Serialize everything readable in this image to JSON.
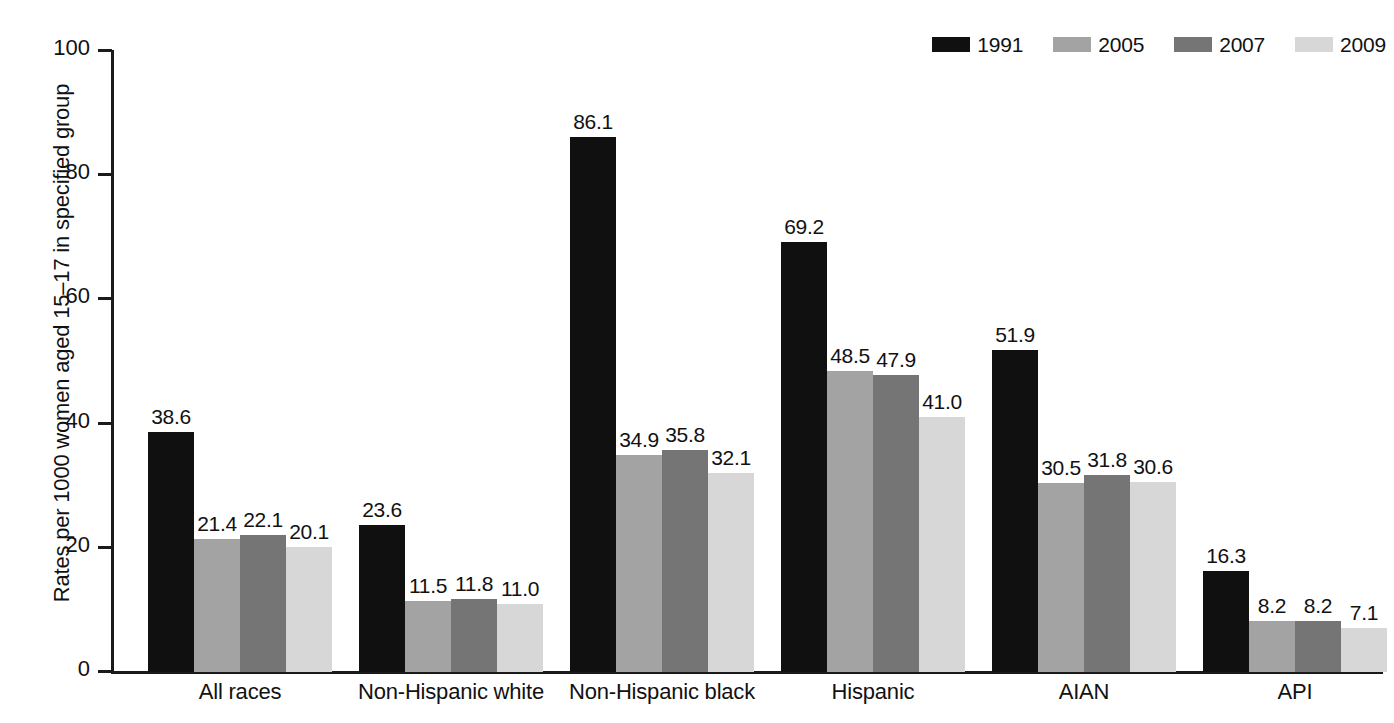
{
  "chart_data": {
    "type": "bar",
    "title": "",
    "subtitle": "",
    "xlabel": "",
    "ylabel": "Rates per 1000 women aged 15–17 in specified group",
    "ylim": [
      0,
      100
    ],
    "yticks": [
      0,
      20,
      40,
      60,
      80,
      100
    ],
    "ytick_labels": [
      "0",
      "20",
      "40",
      "60",
      "80",
      "100"
    ],
    "grid": false,
    "legend_position": "top-right",
    "categories": [
      "All races",
      "Non-Hispanic white",
      "Non-Hispanic black",
      "Hispanic",
      "AIAN",
      "API"
    ],
    "series": [
      {
        "name": "1991",
        "color": "#101010",
        "values": [
          38.6,
          23.6,
          86.1,
          69.2,
          51.9,
          16.3
        ],
        "labels": [
          "38.6",
          "23.6",
          "86.1",
          "69.2",
          "51.9",
          "16.3"
        ]
      },
      {
        "name": "2005",
        "color": "#a3a3a3",
        "values": [
          21.4,
          11.5,
          34.9,
          48.5,
          30.5,
          8.2
        ],
        "labels": [
          "21.4",
          "11.5",
          "34.9",
          "48.5",
          "30.5",
          "8.2"
        ]
      },
      {
        "name": "2007",
        "color": "#757575",
        "values": [
          22.1,
          11.8,
          35.8,
          47.9,
          31.8,
          8.2
        ],
        "labels": [
          "22.1",
          "11.8",
          "35.8",
          "47.9",
          "31.8",
          "8.2"
        ]
      },
      {
        "name": "2009",
        "color": "#d7d7d7",
        "values": [
          20.1,
          11.0,
          32.1,
          41.0,
          30.6,
          7.1
        ],
        "labels": [
          "20.1",
          "11.0",
          "32.1",
          "41.0",
          "30.6",
          "7.1"
        ]
      }
    ]
  },
  "legend": {
    "items": [
      {
        "label": "1991",
        "color": "#101010"
      },
      {
        "label": "2005",
        "color": "#a3a3a3"
      },
      {
        "label": "2007",
        "color": "#757575"
      },
      {
        "label": "2009",
        "color": "#d7d7d7"
      }
    ]
  },
  "axes": {
    "y_title": "Rates per 1000 women aged 15–17 in specified group",
    "y_tick_labels": [
      "100",
      "80",
      "60",
      "40",
      "20",
      "0"
    ]
  },
  "caption": {
    "sliver_text": ""
  }
}
